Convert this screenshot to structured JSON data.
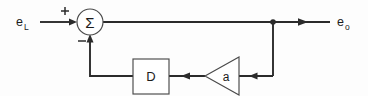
{
  "figure": {
    "kind": "block-diagram",
    "width": 368,
    "height": 96,
    "background_color": "#fdfdfd",
    "line_color": "#2b2b2b",
    "shape_stroke_color": "#4a4a4a",
    "shape_fill_color": "#ffffff",
    "text_color": "#1c1c1c"
  },
  "labels": {
    "input_base": "e",
    "input_subscript": "L",
    "output_base": "e",
    "output_subscript": "o",
    "summing_symbol": "Σ",
    "plus_sign": "+",
    "minus_sign": "−",
    "delay_block": "D",
    "gain_block": "a"
  },
  "nodes": [
    {
      "name": "input-signal",
      "label": "e_L",
      "role": "input source label",
      "x": 22,
      "y": 22
    },
    {
      "name": "summing-junction",
      "label": "Σ",
      "role": "summer",
      "shape": "circle",
      "cx": 90,
      "cy": 22,
      "r": 13,
      "inputs": [
        {
          "port": "left",
          "sign": "+"
        },
        {
          "port": "bottom",
          "sign": "−"
        }
      ]
    },
    {
      "name": "delay-block",
      "label": "D",
      "role": "delay element",
      "shape": "rectangle",
      "x": 133,
      "y": 59,
      "width": 36,
      "height": 35
    },
    {
      "name": "gain-block",
      "label": "a",
      "role": "amplifier / gain",
      "shape": "triangle",
      "apex_x": 205,
      "apex_y": 76,
      "base_x": 239,
      "base_top_y": 57,
      "base_bottom_y": 95,
      "direction": "left"
    },
    {
      "name": "feedback-tap",
      "label": "",
      "role": "junction dot on forward path",
      "shape": "dot",
      "cx": 273,
      "cy": 22,
      "r": 2.6
    },
    {
      "name": "output-signal",
      "label": "e_o",
      "role": "output sink label",
      "x": 340,
      "y": 22
    }
  ],
  "edges": [
    {
      "name": "input-to-summer",
      "from": "input-signal",
      "to": "summing-junction",
      "direction": "right",
      "sign": "+",
      "arrow": true
    },
    {
      "name": "summer-to-output",
      "from": "summing-junction",
      "to": "output-signal",
      "direction": "right",
      "arrow": true
    },
    {
      "name": "tap-to-gain",
      "from": "feedback-tap",
      "to": "gain-block",
      "direction": "left",
      "arrow": true
    },
    {
      "name": "gain-to-delay",
      "from": "gain-block",
      "to": "delay-block",
      "direction": "left",
      "arrow": true
    },
    {
      "name": "delay-to-summer",
      "from": "delay-block",
      "to": "summing-junction",
      "direction": "up",
      "sign": "−",
      "arrow": true
    }
  ]
}
